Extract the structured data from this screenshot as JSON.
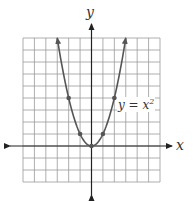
{
  "chart_data": {
    "type": "line",
    "title": "",
    "xlabel": "x",
    "ylabel": "y",
    "equation_label": "y = x²",
    "equation_base": "y = x",
    "equation_exp": "2",
    "xlim": [
      -6,
      6
    ],
    "ylim": [
      -3,
      9
    ],
    "grid": true,
    "series": [
      {
        "name": "y = x^2",
        "x": [
          -3,
          -2,
          -1,
          0,
          1,
          2,
          3
        ],
        "y": [
          9,
          4,
          1,
          0,
          1,
          4,
          9
        ]
      }
    ],
    "marked_points": [
      [
        -2,
        4
      ],
      [
        -1,
        1
      ],
      [
        0,
        0
      ],
      [
        1,
        1
      ],
      [
        2,
        4
      ]
    ]
  },
  "colors": {
    "curve": "#555555",
    "grid": "#9a9a9a",
    "axis": "#222222"
  }
}
